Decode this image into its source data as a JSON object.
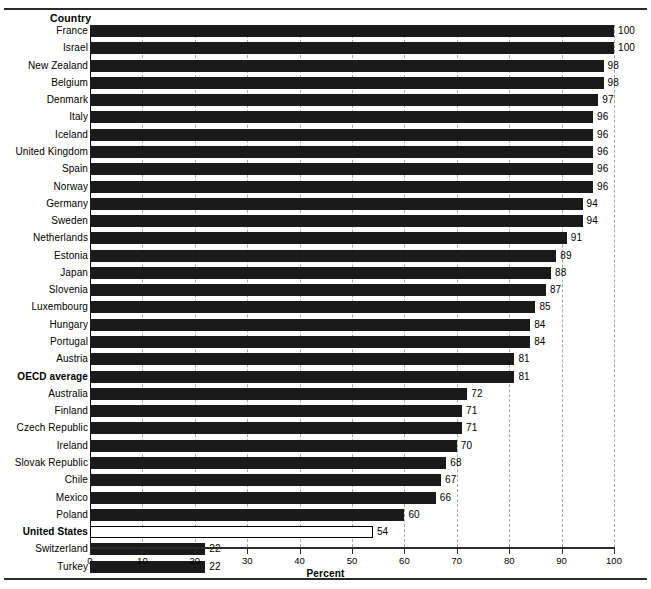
{
  "figure": {
    "column_header": "Country",
    "axis_title": "Percent",
    "clipped_header_text": ""
  },
  "axis": {
    "ticks": [
      0,
      10,
      20,
      30,
      40,
      50,
      60,
      70,
      80,
      90,
      100
    ],
    "tick_labels": [
      "0",
      "10",
      "20",
      "30",
      "40",
      "50",
      "60",
      "70",
      "80",
      "90",
      "100"
    ],
    "min": 0,
    "max": 100
  },
  "chart_data": {
    "type": "bar",
    "orientation": "horizontal",
    "title": "",
    "subtitle": "",
    "xlabel": "Percent",
    "ylabel": "Country",
    "xlim": [
      0,
      100
    ],
    "grid": "vertical-dashed",
    "legend": "none",
    "categories": [
      "France",
      "Israel",
      "New Zealand",
      "Belgium",
      "Denmark",
      "Italy",
      "Iceland",
      "United Kingdom",
      "Spain",
      "Norway",
      "Germany",
      "Sweden",
      "Netherlands",
      "Estonia",
      "Japan",
      "Slovenia",
      "Luxembourg",
      "Hungary",
      "Portugal",
      "Austria",
      "OECD average",
      "Australia",
      "Finland",
      "Czech Republic",
      "Ireland",
      "Slovak Republic",
      "Chile",
      "Mexico",
      "Poland",
      "United States",
      "Switzerland",
      "Turkey"
    ],
    "values": [
      100,
      100,
      98,
      98,
      97,
      96,
      96,
      96,
      96,
      96,
      94,
      94,
      91,
      89,
      88,
      87,
      85,
      84,
      84,
      81,
      81,
      72,
      71,
      71,
      70,
      68,
      67,
      66,
      60,
      54,
      22,
      22
    ],
    "value_labels": [
      "100",
      "100",
      "98",
      "98",
      "97",
      "96",
      "96",
      "96",
      "96",
      "96",
      "94",
      "94",
      "91",
      "89",
      "88",
      "87",
      "85",
      "84",
      "84",
      "81",
      "81",
      "72",
      "71",
      "71",
      "70",
      "68",
      "67",
      "66",
      "60",
      "54",
      "22",
      "22"
    ],
    "highlighted": [
      "OECD average",
      "United States"
    ],
    "hollow_bars": [
      "United States"
    ],
    "colors": {
      "bar_fill": "#1a1a1a",
      "hollow_fill": "#ffffff",
      "hollow_border": "#000000",
      "gridline": "#a8a8a8",
      "axis": "#2b2b2b",
      "text": "#000000"
    }
  }
}
